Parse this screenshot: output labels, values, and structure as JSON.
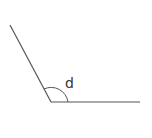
{
  "diagram": {
    "type": "angle",
    "label": "d",
    "line_color": "#555555",
    "vertex": [
      51,
      102
    ],
    "ray1_end": [
      10,
      25
    ],
    "ray2_end": [
      140,
      102
    ]
  }
}
